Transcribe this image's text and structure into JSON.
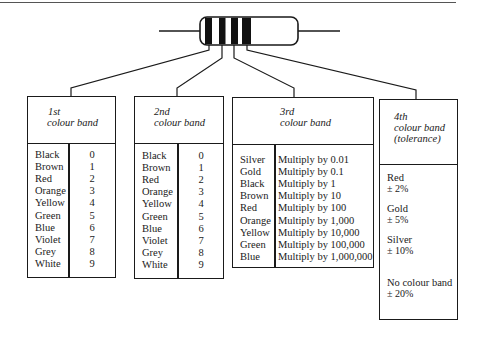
{
  "diagram": {
    "resistor": {
      "bands": [
        "band-1",
        "band-2",
        "band-3",
        "band-4"
      ],
      "band_color": "#111111",
      "body_color": "#ffffff"
    }
  },
  "boxes": {
    "first": {
      "title_line1": "1st",
      "title_line2": "colour band",
      "rows": [
        {
          "colour": "Black",
          "value": "0"
        },
        {
          "colour": "Brown",
          "value": "1"
        },
        {
          "colour": "Red",
          "value": "2"
        },
        {
          "colour": "Orange",
          "value": "3"
        },
        {
          "colour": "Yellow",
          "value": "4"
        },
        {
          "colour": "Green",
          "value": "5"
        },
        {
          "colour": "Blue",
          "value": "6"
        },
        {
          "colour": "Violet",
          "value": "7"
        },
        {
          "colour": "Grey",
          "value": "8"
        },
        {
          "colour": "White",
          "value": "9"
        }
      ]
    },
    "second": {
      "title_line1": "2nd",
      "title_line2": "colour band",
      "rows": [
        {
          "colour": "Black",
          "value": "0"
        },
        {
          "colour": "Brown",
          "value": "1"
        },
        {
          "colour": "Red",
          "value": "2"
        },
        {
          "colour": "Orange",
          "value": "3"
        },
        {
          "colour": "Yellow",
          "value": "4"
        },
        {
          "colour": "Green",
          "value": "5"
        },
        {
          "colour": "Blue",
          "value": "6"
        },
        {
          "colour": "Violet",
          "value": "7"
        },
        {
          "colour": "Grey",
          "value": "8"
        },
        {
          "colour": "White",
          "value": "9"
        }
      ]
    },
    "third": {
      "title_line1": "3rd",
      "title_line2": "colour band",
      "rows": [
        {
          "colour": "Silver",
          "value": "Multiply by 0.01"
        },
        {
          "colour": "Gold",
          "value": "Multiply by 0.1"
        },
        {
          "colour": "Black",
          "value": "Multiply by 1"
        },
        {
          "colour": "Brown",
          "value": "Multiply by 10"
        },
        {
          "colour": "Red",
          "value": "Multiply by 100"
        },
        {
          "colour": "Orange",
          "value": "Multiply by 1,000"
        },
        {
          "colour": "Yellow",
          "value": "Multiply by 10,000"
        },
        {
          "colour": "Green",
          "value": "Multiply by 100,000"
        },
        {
          "colour": "Blue",
          "value": "Multiply by 1,000,000"
        }
      ]
    },
    "fourth": {
      "title_line1": "4th",
      "title_line2": "colour band",
      "title_line3": "(tolerance)",
      "rows": [
        {
          "colour": "Red",
          "value": "± 2%"
        },
        {
          "colour": "Gold",
          "value": "± 5%"
        },
        {
          "colour": "Silver",
          "value": "± 10%"
        },
        {
          "colour": "No colour band",
          "value": "± 20%"
        }
      ]
    }
  }
}
